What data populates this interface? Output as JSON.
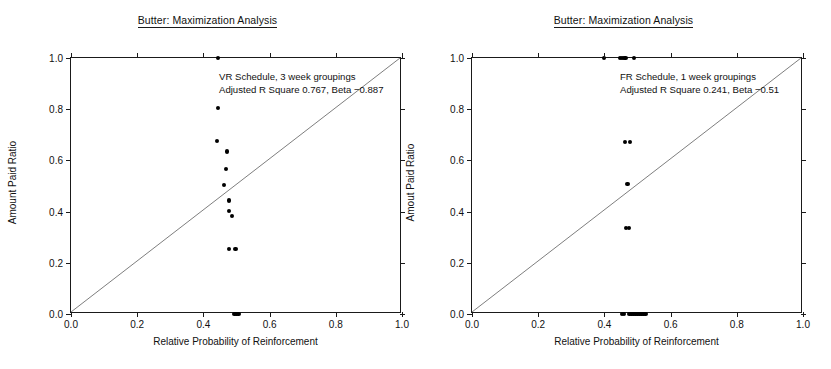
{
  "figure": {
    "width": 831,
    "height": 369,
    "background": "#ffffff",
    "point_color": "#000000",
    "line_color": "#6e6e6e",
    "axis_color": "#1a1a1a"
  },
  "panels": [
    {
      "id": "left",
      "title": "Butter: Maximization Analysis",
      "annotation_line1": "VR Schedule, 3 week groupings",
      "annotation_line2": "Adjusted R Square 0.767, Beta −0.887",
      "xlabel": "Relative Probability of Reinforcement",
      "ylabel": "Amount Paid Ratio",
      "xticks": [
        "0.0",
        "0.2",
        "0.4",
        "0.6",
        "0.8",
        "1.0"
      ],
      "yticks": [
        "0.0",
        "0.2",
        "0.4",
        "0.6",
        "0.8",
        "1.0"
      ]
    },
    {
      "id": "right",
      "title": "Butter: Maximization Analysis",
      "annotation_line1": "FR Schedule, 1 week groupings",
      "annotation_line2": "Adjusted R Square 0.241, Beta −0.51",
      "xlabel": "Relative Probability of Reinforcement",
      "ylabel": "Amout Paid Ratio",
      "xticks": [
        "0.0",
        "0.2",
        "0.4",
        "0.6",
        "0.8",
        "1.0"
      ],
      "yticks": [
        "0.0",
        "0.2",
        "0.4",
        "0.6",
        "0.8",
        "1.0"
      ]
    }
  ],
  "chart_data": [
    {
      "type": "scatter",
      "panel": "left",
      "title": "Butter: Maximization Analysis",
      "subtitle": "VR Schedule, 3 week groupings",
      "annotation": "Adjusted R Square 0.767, Beta −0.887",
      "xlabel": "Relative Probability of Reinforcement",
      "ylabel": "Amount Paid Ratio",
      "xlim": [
        0.0,
        1.0
      ],
      "ylim": [
        0.0,
        1.0
      ],
      "xticks": [
        0.0,
        0.2,
        0.4,
        0.6,
        0.8,
        1.0
      ],
      "yticks": [
        0.0,
        0.2,
        0.4,
        0.6,
        0.8,
        1.0
      ],
      "grid": false,
      "legend": null,
      "reference_line": {
        "name": "identity y=x",
        "from": [
          0.0,
          0.0
        ],
        "to": [
          1.0,
          1.0
        ]
      },
      "points": [
        {
          "x": 0.445,
          "y": 1.0
        },
        {
          "x": 0.445,
          "y": 0.805
        },
        {
          "x": 0.442,
          "y": 0.675
        },
        {
          "x": 0.472,
          "y": 0.635
        },
        {
          "x": 0.468,
          "y": 0.565
        },
        {
          "x": 0.462,
          "y": 0.505
        },
        {
          "x": 0.478,
          "y": 0.443
        },
        {
          "x": 0.478,
          "y": 0.403
        },
        {
          "x": 0.487,
          "y": 0.383
        },
        {
          "x": 0.478,
          "y": 0.255
        },
        {
          "x": 0.497,
          "y": 0.255
        },
        {
          "x": 0.494,
          "y": 0.0
        },
        {
          "x": 0.5,
          "y": 0.0
        },
        {
          "x": 0.506,
          "y": 0.0
        }
      ]
    },
    {
      "type": "scatter",
      "panel": "right",
      "title": "Butter: Maximization Analysis",
      "subtitle": "FR Schedule, 1 week groupings",
      "annotation": "Adjusted R Square 0.241, Beta −0.51",
      "xlabel": "Relative Probability of Reinforcement",
      "ylabel": "Amout Paid Ratio",
      "xlim": [
        0.0,
        1.0
      ],
      "ylim": [
        0.0,
        1.0
      ],
      "xticks": [
        0.0,
        0.2,
        0.4,
        0.6,
        0.8,
        1.0
      ],
      "yticks": [
        0.0,
        0.2,
        0.4,
        0.6,
        0.8,
        1.0
      ],
      "grid": false,
      "legend": null,
      "reference_line": {
        "name": "identity y=x",
        "from": [
          0.0,
          0.0
        ],
        "to": [
          1.0,
          1.0
        ]
      },
      "points": [
        {
          "x": 0.4,
          "y": 1.0
        },
        {
          "x": 0.446,
          "y": 1.0
        },
        {
          "x": 0.452,
          "y": 1.0
        },
        {
          "x": 0.458,
          "y": 1.0
        },
        {
          "x": 0.464,
          "y": 1.0
        },
        {
          "x": 0.49,
          "y": 1.0
        },
        {
          "x": 0.462,
          "y": 0.672
        },
        {
          "x": 0.478,
          "y": 0.672
        },
        {
          "x": 0.47,
          "y": 0.508
        },
        {
          "x": 0.466,
          "y": 0.335
        },
        {
          "x": 0.474,
          "y": 0.335
        },
        {
          "x": 0.452,
          "y": 0.0
        },
        {
          "x": 0.458,
          "y": 0.0
        },
        {
          "x": 0.476,
          "y": 0.0
        },
        {
          "x": 0.482,
          "y": 0.0
        },
        {
          "x": 0.488,
          "y": 0.0
        },
        {
          "x": 0.494,
          "y": 0.0
        },
        {
          "x": 0.5,
          "y": 0.0
        },
        {
          "x": 0.506,
          "y": 0.0
        },
        {
          "x": 0.512,
          "y": 0.0
        },
        {
          "x": 0.518,
          "y": 0.0
        },
        {
          "x": 0.524,
          "y": 0.0
        }
      ]
    }
  ]
}
